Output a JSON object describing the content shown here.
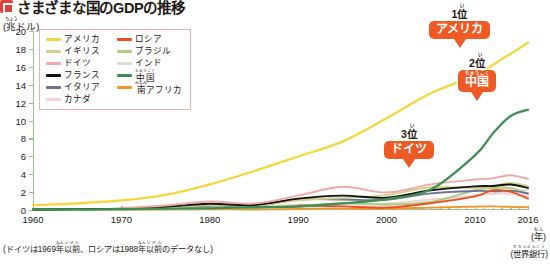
{
  "header": {
    "title": "さまざまな国のGDPの推移",
    "marker_icon": "red-square-icon"
  },
  "axes": {
    "y_unit": "(兆ドル)",
    "y_unit_ruby": "ちょう",
    "y_ticks": [
      "0",
      "2",
      "4",
      "6",
      "8",
      "10",
      "12",
      "14",
      "16",
      "18",
      "20"
    ],
    "x_ticks": [
      "1960",
      "1970",
      "1980",
      "1990",
      "2000",
      "2010",
      "2016"
    ],
    "x_unit": "(年)",
    "x_unit_ruby": "ねん"
  },
  "legend": {
    "items": [
      {
        "label": "アメリカ",
        "color": "#f5d73c",
        "col": 0
      },
      {
        "label": "ロシア",
        "color": "#f04e1e",
        "col": 1
      },
      {
        "label": "イギリス",
        "color": "#cfd08a",
        "col": 0
      },
      {
        "label": "ブラジル",
        "color": "#a9cf7d",
        "col": 1
      },
      {
        "label": "ドイツ",
        "color": "#f2a8a8",
        "col": 0
      },
      {
        "label": "インド",
        "color": "#dcdcd4",
        "col": 1
      },
      {
        "label": "フランス",
        "color": "#111111",
        "col": 0
      },
      {
        "label": "中国",
        "color": "#3f8f52",
        "col": 1,
        "ruby": "ちゅうごく"
      },
      {
        "label": "イタリア",
        "color": "#6d7394",
        "col": 0
      },
      {
        "label": "南アフリカ",
        "color": "#f0952a",
        "col": 1,
        "ruby": "みなみ"
      },
      {
        "label": "カナダ",
        "color": "#f7cfd6",
        "col": 0
      }
    ]
  },
  "callouts": [
    {
      "rank": "1位",
      "rank_ruby": "い",
      "country": "アメリカ",
      "color": "#ef5a24"
    },
    {
      "rank": "2位",
      "rank_ruby": "い",
      "country": "中国",
      "country_ruby": "ちゅうごく",
      "color": "#ef5a24"
    },
    {
      "rank": "3位",
      "rank_ruby": "い",
      "country": "ドイツ",
      "color": "#ef5a24"
    }
  ],
  "notes": {
    "footnote": "(ドイツは1969年以前、ロシアは1988年以前のデータなし)",
    "footnote_ruby_1": "ねん",
    "footnote_ruby_2": "いぜん",
    "source": "(世界銀行)",
    "source_ruby": "せかいぎんこう"
  },
  "chart_data": {
    "type": "line",
    "title": "さまざまな国のGDPの推移",
    "xlabel": "(年)",
    "ylabel": "(兆ドル)",
    "xlim": [
      1960,
      2016
    ],
    "ylim": [
      0,
      20
    ],
    "grid": false,
    "legend_position": "top-left",
    "x": [
      1960,
      1965,
      1970,
      1975,
      1980,
      1985,
      1990,
      1995,
      2000,
      2005,
      2010,
      2012,
      2014,
      2016
    ],
    "series": [
      {
        "name": "アメリカ",
        "color": "#f5d73c",
        "values": [
          0.54,
          0.74,
          1.07,
          1.69,
          2.86,
          4.35,
          5.98,
          7.64,
          10.25,
          13.04,
          14.99,
          16.2,
          17.43,
          18.71
        ]
      },
      {
        "name": "中国",
        "color": "#3f8f52",
        "ruby": "ちゅうごく",
        "values": [
          0.06,
          0.07,
          0.09,
          0.16,
          0.19,
          0.31,
          0.39,
          0.73,
          1.21,
          2.29,
          6.1,
          8.53,
          10.48,
          11.2
        ]
      },
      {
        "name": "ドイツ",
        "color": "#f2a8a8",
        "values": [
          null,
          null,
          0.21,
          0.5,
          0.95,
          0.72,
          1.6,
          2.59,
          1.95,
          2.86,
          3.4,
          3.53,
          3.89,
          3.47
        ]
      },
      {
        "name": "イギリス",
        "color": "#cfd08a",
        "values": [
          0.07,
          0.1,
          0.13,
          0.24,
          0.56,
          0.49,
          1.09,
          1.34,
          1.66,
          2.54,
          2.45,
          2.66,
          3.02,
          2.69
        ]
      },
      {
        "name": "フランス",
        "color": "#111111",
        "values": [
          0.06,
          0.1,
          0.15,
          0.36,
          0.7,
          0.56,
          1.27,
          1.61,
          1.37,
          2.2,
          2.64,
          2.68,
          2.85,
          2.47
        ]
      },
      {
        "name": "インド",
        "color": "#dcdcd4",
        "values": [
          0.04,
          0.06,
          0.06,
          0.1,
          0.19,
          0.23,
          0.32,
          0.37,
          0.47,
          0.82,
          1.68,
          1.83,
          2.04,
          2.26
        ]
      },
      {
        "name": "イタリア",
        "color": "#6d7394",
        "values": [
          0.04,
          0.07,
          0.11,
          0.22,
          0.48,
          0.44,
          1.18,
          1.17,
          1.14,
          1.86,
          2.13,
          2.09,
          2.16,
          1.86
        ]
      },
      {
        "name": "ブラジル",
        "color": "#a9cf7d",
        "values": [
          0.02,
          0.02,
          0.04,
          0.12,
          0.24,
          0.22,
          0.46,
          0.77,
          0.65,
          0.89,
          2.21,
          2.46,
          2.46,
          1.8
        ]
      },
      {
        "name": "カナダ",
        "color": "#f7cfd6",
        "values": [
          0.04,
          0.05,
          0.09,
          0.17,
          0.27,
          0.36,
          0.59,
          0.6,
          0.74,
          1.17,
          1.61,
          1.82,
          1.8,
          1.53
        ]
      },
      {
        "name": "ロシア",
        "color": "#f04e1e",
        "values": [
          null,
          null,
          null,
          null,
          null,
          null,
          0.52,
          0.4,
          0.26,
          0.76,
          1.52,
          2.21,
          2.06,
          1.28
        ]
      },
      {
        "name": "南アフリカ",
        "color": "#f0952a",
        "ruby": "みなみ",
        "values": [
          0.01,
          0.01,
          0.02,
          0.04,
          0.08,
          0.06,
          0.12,
          0.15,
          0.14,
          0.26,
          0.38,
          0.4,
          0.35,
          0.3
        ]
      }
    ]
  }
}
